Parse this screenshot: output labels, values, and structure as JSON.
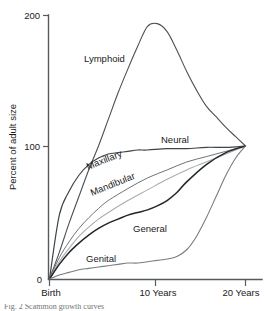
{
  "chart_data": {
    "type": "line",
    "title": "",
    "xlabel": "",
    "ylabel": "Percent of adult size",
    "xlim": [
      0,
      20
    ],
    "ylim": [
      0,
      200
    ],
    "grid": false,
    "legend_position": "inline-labels",
    "x_tick_labels": [
      "Birth",
      "10 Years",
      "20 Years"
    ],
    "x_tick_values": [
      0,
      10,
      20
    ],
    "y_tick_labels": [
      "0",
      "100",
      "200"
    ],
    "y_tick_values": [
      0,
      100,
      200
    ],
    "series": [
      {
        "name": "Lymphoid",
        "color": "#4c5052",
        "width": 1.1,
        "x": [
          0,
          1,
          2,
          3,
          4,
          5,
          6,
          7,
          8,
          9,
          10,
          11,
          12,
          13,
          14,
          15,
          16,
          17,
          18,
          19,
          20
        ],
        "values": [
          0,
          20,
          42,
          62,
          82,
          100,
          120,
          140,
          158,
          175,
          190,
          192,
          186,
          172,
          156,
          142,
          130,
          122,
          114,
          107,
          100
        ]
      },
      {
        "name": "Neural",
        "color": "#3f4446",
        "width": 1.2,
        "x": [
          0,
          1,
          2,
          3,
          4,
          5,
          6,
          7,
          8,
          9,
          10,
          12,
          14,
          16,
          18,
          20
        ],
        "values": [
          0,
          48,
          66,
          78,
          86,
          91,
          94,
          95,
          96,
          97,
          97,
          98,
          98,
          99,
          99,
          100
        ]
      },
      {
        "name": "Maxillary",
        "color": "#6d7274",
        "width": 1.0,
        "x": [
          0,
          1,
          2,
          3,
          4,
          5,
          6,
          8,
          10,
          12,
          14,
          16,
          18,
          20
        ],
        "values": [
          0,
          16,
          28,
          38,
          46,
          53,
          59,
          68,
          76,
          82,
          88,
          92,
          96,
          100
        ]
      },
      {
        "name": "Mandibular",
        "color": "#a9adae",
        "width": 1.1,
        "x": [
          0,
          1,
          2,
          3,
          4,
          5,
          6,
          8,
          10,
          12,
          14,
          16,
          18,
          20
        ],
        "values": [
          0,
          13,
          23,
          32,
          39,
          45,
          50,
          59,
          67,
          75,
          82,
          88,
          94,
          100
        ]
      },
      {
        "name": "General",
        "color": "#22262a",
        "width": 1.5,
        "x": [
          0,
          1,
          2,
          3,
          4,
          5,
          6,
          7,
          8,
          9,
          10,
          11,
          12,
          13,
          14,
          16,
          18,
          20
        ],
        "values": [
          0,
          11,
          20,
          27,
          33,
          38,
          42,
          45,
          48,
          50,
          52,
          55,
          59,
          65,
          73,
          86,
          95,
          100
        ]
      },
      {
        "name": "Genital",
        "color": "#787d7f",
        "width": 1.1,
        "x": [
          0,
          1,
          2,
          3,
          4,
          5,
          6,
          7,
          8,
          9,
          10,
          11,
          12,
          13,
          14,
          15,
          16,
          17,
          18,
          19,
          20
        ],
        "values": [
          0,
          3,
          5,
          7,
          8,
          9,
          10,
          11,
          12,
          12,
          13,
          14,
          15,
          17,
          22,
          32,
          46,
          62,
          78,
          91,
          100
        ]
      }
    ],
    "annotations": [
      {
        "text": "Lymphoid",
        "x_px": 84,
        "y_px": 62,
        "rotate": 0
      },
      {
        "text": "Neural",
        "x_px": 161,
        "y_px": 143,
        "rotate": 0
      },
      {
        "text": "Maxillary",
        "x_px": 88,
        "y_px": 170,
        "rotate": -22
      },
      {
        "text": "Mandibular",
        "x_px": 92,
        "y_px": 196,
        "rotate": -22
      },
      {
        "text": "General",
        "x_px": 133,
        "y_px": 232,
        "rotate": 0
      },
      {
        "text": "Genital",
        "x_px": 86,
        "y_px": 262,
        "rotate": 0
      }
    ]
  },
  "caption": {
    "text": "Fig. 2 Scammon growth curves"
  }
}
